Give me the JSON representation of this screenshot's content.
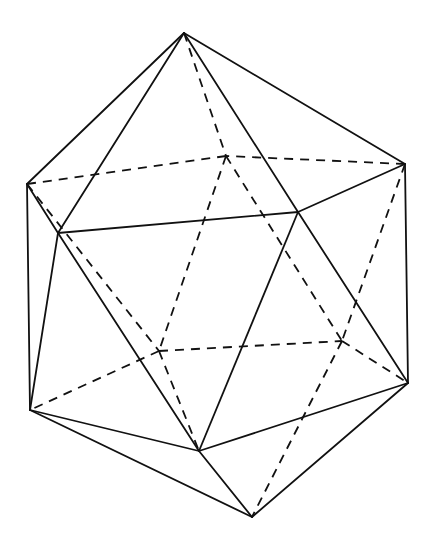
{
  "diagram": {
    "subject": "Icosahedron (wireframe line drawing with hidden edges dashed)",
    "stroke_color": "#111111",
    "background_color": "#ffffff",
    "vertices": {
      "T": [
        184,
        33
      ],
      "UL": [
        27,
        184
      ],
      "BC": [
        226,
        156
      ],
      "UR": [
        405,
        164
      ],
      "FL": [
        58,
        233
      ],
      "FR": [
        298,
        212
      ],
      "LL": [
        30,
        410
      ],
      "BL": [
        159,
        351
      ],
      "BR": [
        342,
        341
      ],
      "LR": [
        408,
        383
      ],
      "FB": [
        199,
        451
      ],
      "BOT": [
        252,
        517
      ]
    },
    "solid_edges": [
      [
        "T",
        "UL"
      ],
      [
        "T",
        "FL"
      ],
      [
        "T",
        "FR"
      ],
      [
        "T",
        "UR"
      ],
      [
        "UL",
        "FL"
      ],
      [
        "UL",
        "LL"
      ],
      [
        "FL",
        "FR"
      ],
      [
        "FL",
        "LL"
      ],
      [
        "FL",
        "FB"
      ],
      [
        "FR",
        "UR"
      ],
      [
        "FR",
        "FB"
      ],
      [
        "FR",
        "LR"
      ],
      [
        "UR",
        "LR"
      ],
      [
        "LL",
        "FB"
      ],
      [
        "LL",
        "BOT"
      ],
      [
        "FB",
        "LR"
      ],
      [
        "FB",
        "BOT"
      ],
      [
        "LR",
        "BOT"
      ]
    ],
    "dashed_edges": [
      [
        "T",
        "BC"
      ],
      [
        "UL",
        "BC"
      ],
      [
        "UR",
        "BC"
      ],
      [
        "BC",
        "BL"
      ],
      [
        "BC",
        "BR"
      ],
      [
        "UL",
        "BL"
      ],
      [
        "UR",
        "BR"
      ],
      [
        "BL",
        "BR"
      ],
      [
        "BL",
        "LL"
      ],
      [
        "BL",
        "FB"
      ],
      [
        "BR",
        "LR"
      ],
      [
        "BR",
        "BOT"
      ]
    ]
  }
}
